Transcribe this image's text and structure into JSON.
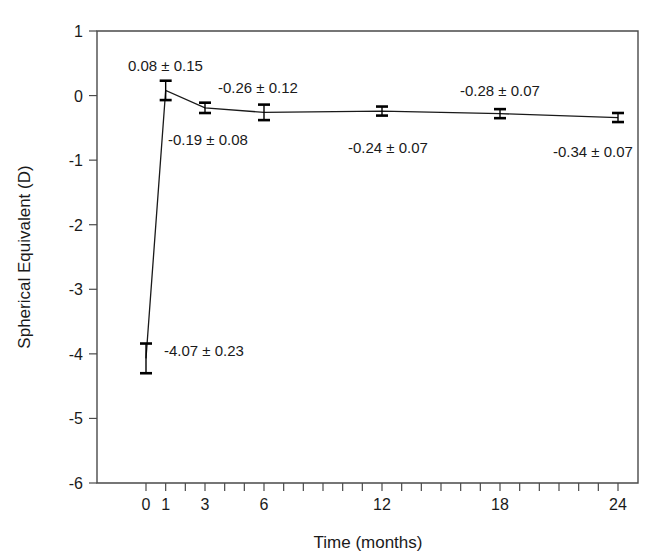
{
  "chart_data": {
    "type": "line",
    "title": "",
    "xlabel": "Time (months)",
    "ylabel": "Spherical Equivalent (D)",
    "xlim": [
      -1,
      25
    ],
    "ylim": [
      -6,
      1
    ],
    "grid": false,
    "legend": "none",
    "x": [
      0,
      1,
      3,
      6,
      12,
      18,
      24
    ],
    "xtick_labels": [
      "0",
      "1",
      "3",
      "6",
      "12",
      "18",
      "24"
    ],
    "xtick_values": [
      0,
      1,
      3,
      6,
      12,
      18,
      24
    ],
    "xtick_minor_values": [
      0,
      1,
      2,
      3,
      4,
      5,
      6,
      7,
      8,
      9,
      10,
      11,
      12,
      13,
      14,
      15,
      16,
      17,
      18,
      19,
      20,
      21,
      22,
      23,
      24
    ],
    "ytick_labels": [
      "1",
      "0",
      "-1",
      "-2",
      "-3",
      "-4",
      "-5",
      "-6"
    ],
    "ytick_values": [
      1,
      0,
      -1,
      -2,
      -3,
      -4,
      -5,
      -6
    ],
    "series": [
      {
        "name": "Spherical Equivalent",
        "values": [
          -4.07,
          0.08,
          -0.19,
          -0.26,
          -0.24,
          -0.28,
          -0.34
        ],
        "errors": [
          0.23,
          0.15,
          0.08,
          0.12,
          0.07,
          0.07,
          0.07
        ]
      }
    ],
    "annotations": [
      {
        "text": "0.08 ± 0.15",
        "x": 1,
        "y": 0.08,
        "tx": 128,
        "ty": 71
      },
      {
        "text": "-4.07 ± 0.23",
        "x": 0,
        "y": -4.07,
        "tx": 164,
        "ty": 356
      },
      {
        "text": "-0.19 ± 0.08",
        "x": 3,
        "y": -0.19,
        "tx": 168,
        "ty": 145
      },
      {
        "text": "-0.26 ± 0.12",
        "x": 6,
        "y": -0.26,
        "tx": 218,
        "ty": 93
      },
      {
        "text": "-0.24 ± 0.07",
        "x": 12,
        "y": -0.24,
        "tx": 348,
        "ty": 153
      },
      {
        "text": "-0.28 ± 0.07",
        "x": 18,
        "y": -0.28,
        "tx": 460,
        "ty": 96
      },
      {
        "text": "-0.34 ± 0.07",
        "x": 24,
        "y": -0.34,
        "tx": 553,
        "ty": 157
      }
    ],
    "colors": {
      "line": "#1a1a1a",
      "error_bar": "#000000",
      "axis": "#4a4a4a",
      "text": "#1a1a1a",
      "background": "#ffffff"
    }
  }
}
